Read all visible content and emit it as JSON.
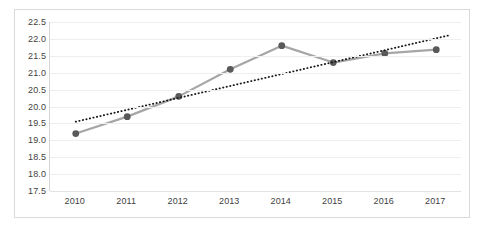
{
  "chart_data": {
    "type": "line",
    "title": "",
    "subtitle": "",
    "xlabel": "",
    "ylabel": "",
    "categories": [
      "2010",
      "2011",
      "2012",
      "2013",
      "2014",
      "2015",
      "2016",
      "2017"
    ],
    "series": [
      {
        "name": "series-1",
        "type": "line",
        "marker": "circle",
        "color": "#a6a6a6",
        "marker_color": "#595959",
        "values": [
          19.2,
          19.7,
          20.3,
          21.1,
          21.8,
          21.3,
          21.57,
          21.68
        ]
      },
      {
        "name": "trendline",
        "type": "line",
        "style": "dotted",
        "color": "#1a1a1a",
        "x": [
          "2010",
          "2017"
        ],
        "values": [
          19.55,
          22.1
        ]
      }
    ],
    "ylim": [
      17.5,
      22.5
    ],
    "yticks": [
      "17.5",
      "18.0",
      "18.5",
      "19.0",
      "19.5",
      "20.0",
      "20.5",
      "21.0",
      "21.5",
      "22.0",
      "22.5"
    ],
    "ytick_values": [
      17.5,
      18.0,
      18.5,
      19.0,
      19.5,
      20.0,
      20.5,
      21.0,
      21.5,
      22.0,
      22.5
    ],
    "xticks": [
      "2010",
      "2011",
      "2012",
      "2013",
      "2014",
      "2015",
      "2016",
      "2017"
    ],
    "grid": true,
    "grid_color": "#eeeeee",
    "legend": false,
    "legend_position": "none",
    "plot_background": "#ffffff",
    "border_color": "#d9d9d9",
    "axis_color": "#d4d4d4",
    "tick_label_color": "#3f3f3f",
    "annotations": []
  }
}
